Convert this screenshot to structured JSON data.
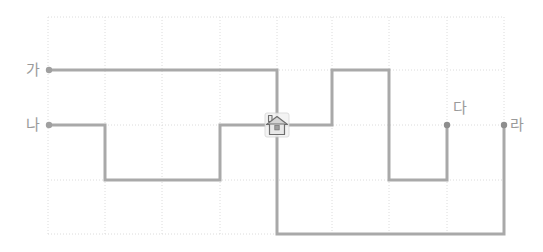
{
  "figure": {
    "type": "grid-path-diagram",
    "background_color": "#ffffff",
    "grid": {
      "line_color": "#dcdcdc",
      "line_style": "dotted",
      "x_positions": [
        48,
        105,
        162,
        220,
        277,
        332,
        389,
        447,
        504
      ],
      "y_positions": [
        17,
        70,
        125,
        180,
        234
      ],
      "columns": 8,
      "rows": 4,
      "cell_width": 57,
      "cell_height": 54
    },
    "path": {
      "color": "#a9a9a9",
      "width": 3,
      "cap": "square"
    },
    "house_icon": {
      "name": "house-icon",
      "x": 277,
      "y": 125,
      "size": 22,
      "fill": "#d4d4d4",
      "stroke": "#6e6e6e",
      "body_fill": "#e8e8e8"
    },
    "nodes": [
      {
        "id": "ga",
        "label": "가",
        "x": 49,
        "y": 70,
        "label_x": 26,
        "label_y": 62,
        "dot_color": "#a0a0a0"
      },
      {
        "id": "na",
        "label": "나",
        "x": 49,
        "y": 125,
        "label_x": 26,
        "label_y": 117,
        "dot_color": "#a0a0a0"
      },
      {
        "id": "da",
        "label": "다",
        "x": 447,
        "y": 125,
        "label_x": 453,
        "label_y": 100,
        "dot_color": "#8e8e8e"
      },
      {
        "id": "ra",
        "label": "라",
        "x": 504,
        "y": 125,
        "label_x": 510,
        "label_y": 117,
        "dot_color": "#8e8e8e"
      }
    ],
    "routes": [
      {
        "name": "route-ga",
        "start_node": "가",
        "end_node": "house",
        "points": [
          [
            49,
            70
          ],
          [
            277,
            70
          ],
          [
            277,
            125
          ]
        ]
      },
      {
        "name": "route-na",
        "start_node": "나",
        "end_node": "house",
        "points": [
          [
            49,
            125
          ],
          [
            105,
            125
          ],
          [
            105,
            180
          ],
          [
            220,
            180
          ],
          [
            220,
            125
          ],
          [
            277,
            125
          ]
        ]
      },
      {
        "name": "route-da",
        "start_node": "house",
        "end_node": "다",
        "points": [
          [
            277,
            125
          ],
          [
            332,
            125
          ],
          [
            332,
            70
          ],
          [
            389,
            70
          ],
          [
            389,
            180
          ],
          [
            447,
            180
          ],
          [
            447,
            125
          ]
        ]
      },
      {
        "name": "route-ra",
        "start_node": "house",
        "end_node": "라",
        "points": [
          [
            277,
            125
          ],
          [
            277,
            234
          ],
          [
            504,
            234
          ],
          [
            504,
            125
          ]
        ]
      }
    ]
  }
}
